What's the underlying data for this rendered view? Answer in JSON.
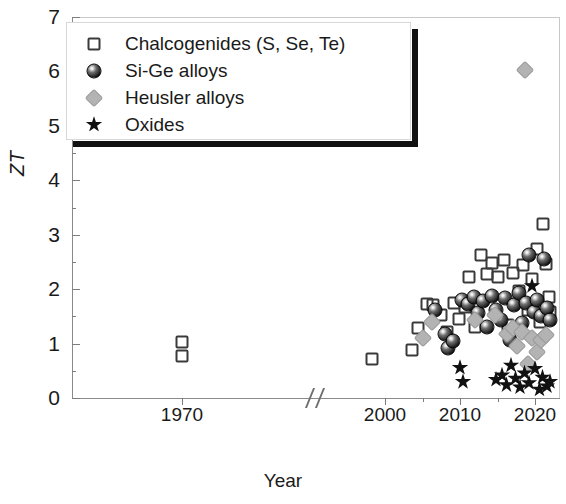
{
  "figure": {
    "axis_title_y": "ZT",
    "axis_title_x": "Year"
  },
  "legend": {
    "entries": [
      {
        "label": "Chalcogenides (S, Se, Te)",
        "marker": "open-square",
        "color": "#3a3a3a"
      },
      {
        "label": "Si-Ge alloys",
        "marker": "shaded-sphere",
        "color": "#1b1b1b"
      },
      {
        "label": "Heusler alloys",
        "marker": "gray-diamond",
        "color": "#b3b3b3"
      },
      {
        "label": "Oxides",
        "marker": "black-star",
        "color": "#111111"
      }
    ]
  },
  "chart_data": {
    "type": "scatter",
    "title": "",
    "xlabel": "Year",
    "ylabel": "ZT",
    "ylim": [
      0,
      7
    ],
    "ytick_labels": [
      "0",
      "1",
      "2",
      "3",
      "4",
      "5",
      "6",
      "7"
    ],
    "ytick_values": [
      0,
      1,
      2,
      3,
      4,
      5,
      6,
      7
    ],
    "yminor_step": 0.5,
    "xtick_labels": [
      "1970",
      "2000",
      "2010",
      "2020"
    ],
    "xtick_values": [
      1970,
      2000,
      2010,
      2020
    ],
    "axis_break": {
      "present": true,
      "symbol": "//",
      "between": [
        1975,
        1996
      ]
    },
    "grid": false,
    "legend_position": "upper-left",
    "series": [
      {
        "name": "Chalcogenides (S, Se, Te)",
        "marker": "open-square",
        "color": "#3a3a3a",
        "points": [
          [
            1970.0,
            1.02
          ],
          [
            1970.0,
            0.78
          ],
          [
            1998.2,
            0.72
          ],
          [
            2003.6,
            0.88
          ],
          [
            2004.4,
            1.28
          ],
          [
            2005.6,
            1.72
          ],
          [
            2006.4,
            1.7
          ],
          [
            2007.4,
            1.52
          ],
          [
            2008.3,
            1.22
          ],
          [
            2009.2,
            1.74
          ],
          [
            2009.8,
            1.46
          ],
          [
            2010.6,
            1.68
          ],
          [
            2011.2,
            2.22
          ],
          [
            2012.0,
            1.3
          ],
          [
            2012.8,
            2.62
          ],
          [
            2013.6,
            2.28
          ],
          [
            2014.3,
            2.48
          ],
          [
            2015.0,
            2.22
          ],
          [
            2015.8,
            2.54
          ],
          [
            2016.4,
            1.34
          ],
          [
            2017.0,
            2.3
          ],
          [
            2017.8,
            1.96
          ],
          [
            2018.4,
            2.44
          ],
          [
            2019.0,
            1.62
          ],
          [
            2019.6,
            2.18
          ],
          [
            2020.2,
            2.74
          ],
          [
            2020.6,
            1.4
          ],
          [
            2021.0,
            3.2
          ],
          [
            2021.4,
            2.46
          ],
          [
            2021.8,
            1.86
          ],
          [
            2022.0,
            1.58
          ]
        ]
      },
      {
        "name": "Si-Ge alloys",
        "marker": "shaded-sphere",
        "color": "#1b1b1b",
        "points": [
          [
            2006.6,
            1.62
          ],
          [
            2008.0,
            1.18
          ],
          [
            2008.4,
            0.92
          ],
          [
            2009.0,
            1.04
          ],
          [
            2010.2,
            1.8
          ],
          [
            2011.0,
            1.72
          ],
          [
            2011.8,
            1.86
          ],
          [
            2012.4,
            1.56
          ],
          [
            2013.0,
            1.78
          ],
          [
            2013.6,
            1.3
          ],
          [
            2014.2,
            1.88
          ],
          [
            2014.8,
            1.62
          ],
          [
            2015.4,
            1.44
          ],
          [
            2016.0,
            1.84
          ],
          [
            2016.6,
            1.06
          ],
          [
            2017.2,
            1.7
          ],
          [
            2017.8,
            1.92
          ],
          [
            2018.2,
            1.38
          ],
          [
            2018.8,
            1.74
          ],
          [
            2019.2,
            2.62
          ],
          [
            2019.8,
            1.58
          ],
          [
            2020.2,
            1.8
          ],
          [
            2020.8,
            1.5
          ],
          [
            2021.2,
            2.56
          ],
          [
            2021.6,
            1.66
          ],
          [
            2022.0,
            1.44
          ]
        ]
      },
      {
        "name": "Heusler alloys",
        "marker": "gray-diamond",
        "color": "#b3b3b3",
        "points": [
          [
            2005.0,
            1.1
          ],
          [
            2006.2,
            1.4
          ],
          [
            2012.0,
            1.44
          ],
          [
            2014.6,
            1.52
          ],
          [
            2016.2,
            1.18
          ],
          [
            2017.0,
            1.28
          ],
          [
            2017.6,
            0.96
          ],
          [
            2018.2,
            1.22
          ],
          [
            2018.6,
            6.02
          ],
          [
            2019.0,
            0.62
          ],
          [
            2019.6,
            1.1
          ],
          [
            2020.2,
            0.84
          ],
          [
            2020.8,
            1.06
          ],
          [
            2021.4,
            1.16
          ]
        ]
      },
      {
        "name": "Oxides",
        "marker": "black-star",
        "color": "#111111",
        "points": [
          [
            2010.0,
            0.56
          ],
          [
            2010.4,
            0.3
          ],
          [
            2014.8,
            0.34
          ],
          [
            2015.6,
            0.42
          ],
          [
            2016.2,
            0.24
          ],
          [
            2016.8,
            0.6
          ],
          [
            2017.4,
            0.36
          ],
          [
            2018.0,
            0.2
          ],
          [
            2018.6,
            0.46
          ],
          [
            2019.2,
            0.28
          ],
          [
            2019.6,
            2.06
          ],
          [
            2020.0,
            0.54
          ],
          [
            2020.6,
            0.16
          ],
          [
            2021.0,
            0.38
          ],
          [
            2021.6,
            0.22
          ],
          [
            2022.0,
            0.3
          ]
        ]
      }
    ]
  }
}
